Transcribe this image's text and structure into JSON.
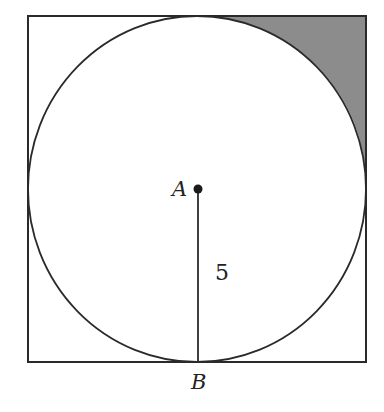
{
  "diagram": {
    "labels": {
      "center": "A",
      "tangent_point": "B",
      "radius": "5"
    },
    "colors": {
      "stroke": "#2a2a2a",
      "shade": "#8c8c8c",
      "background": "#ffffff"
    },
    "geometry": {
      "square": {
        "x": 28,
        "y": 16,
        "size": 338
      },
      "circle": {
        "cx": 197,
        "cy": 189,
        "r": 169
      }
    }
  }
}
